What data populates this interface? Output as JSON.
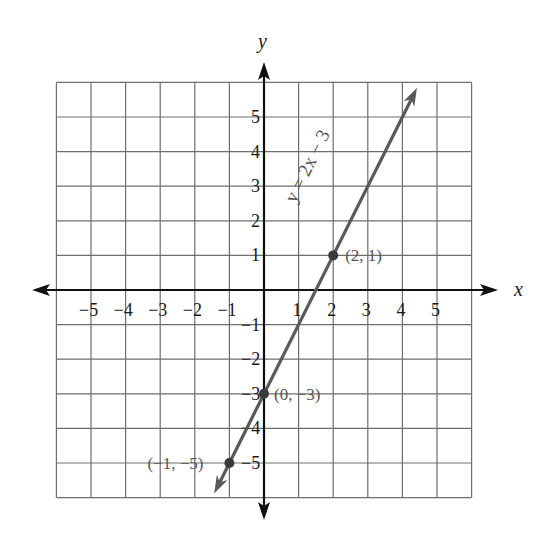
{
  "chart_data": {
    "type": "line",
    "title": "",
    "xlabel": "x",
    "ylabel": "y",
    "xlim": [
      -6,
      6
    ],
    "ylim": [
      -6,
      6
    ],
    "grid": true,
    "x_ticks": [
      "-5",
      "-4",
      "-3",
      "-2",
      "-1",
      "1",
      "2",
      "3",
      "4",
      "5"
    ],
    "y_ticks": [
      "5",
      "4",
      "3",
      "2",
      "1",
      "-1",
      "-2",
      "-3",
      "-4",
      "-5"
    ],
    "series": [
      {
        "name": "y = 2x − 3",
        "slope": 2,
        "intercept": -3,
        "color": "#5a5a5a",
        "x_range": [
          -1.44,
          4.42
        ],
        "marked_points": [
          {
            "x": -1,
            "y": -5,
            "label": "(−1, −5)"
          },
          {
            "x": 0,
            "y": -3,
            "label": "(0, −3)"
          },
          {
            "x": 2,
            "y": 1,
            "label": "(2, 1)"
          }
        ]
      }
    ],
    "annotations": [
      {
        "text": "y = 2x − 3",
        "position": "along line, rotated",
        "anchor_x": 1.7,
        "anchor_y": 3.5
      }
    ],
    "legend": "none"
  },
  "labels": {
    "x_axis": "x",
    "y_axis": "y",
    "equation": "y = 2x − 3",
    "points": [
      "(−1, −5)",
      "(0, −3)",
      "(2, 1)"
    ]
  },
  "colors": {
    "grid": "#6e6e6e",
    "axis": "#111111",
    "line": "#5a5a5a",
    "label": "#555555"
  }
}
